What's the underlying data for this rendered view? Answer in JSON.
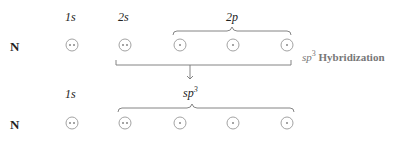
{
  "row1": {
    "element": "N",
    "labels": {
      "s1": "1s",
      "s2": "2s",
      "p2": "2p"
    },
    "orbitals": [
      {
        "name": "1s",
        "electrons": 2
      },
      {
        "name": "2s",
        "electrons": 2
      },
      {
        "name": "2p-1",
        "electrons": 1
      },
      {
        "name": "2p-2",
        "electrons": 1
      },
      {
        "name": "2p-3",
        "electrons": 1
      }
    ]
  },
  "row2": {
    "element": "N",
    "labels": {
      "s1": "1s",
      "hybrid": "sp",
      "hybrid_sup": "3"
    },
    "orbitals": [
      {
        "name": "1s",
        "electrons": 2
      },
      {
        "name": "sp3-1",
        "electrons": 2
      },
      {
        "name": "sp3-2",
        "electrons": 1
      },
      {
        "name": "sp3-3",
        "electrons": 1
      },
      {
        "name": "sp3-4",
        "electrons": 1
      }
    ]
  },
  "caption": {
    "sp": "sp",
    "sup": "3",
    "text": "Hybridization"
  },
  "colors": {
    "line": "#888888",
    "circle": "#999999",
    "dot": "#333333"
  }
}
